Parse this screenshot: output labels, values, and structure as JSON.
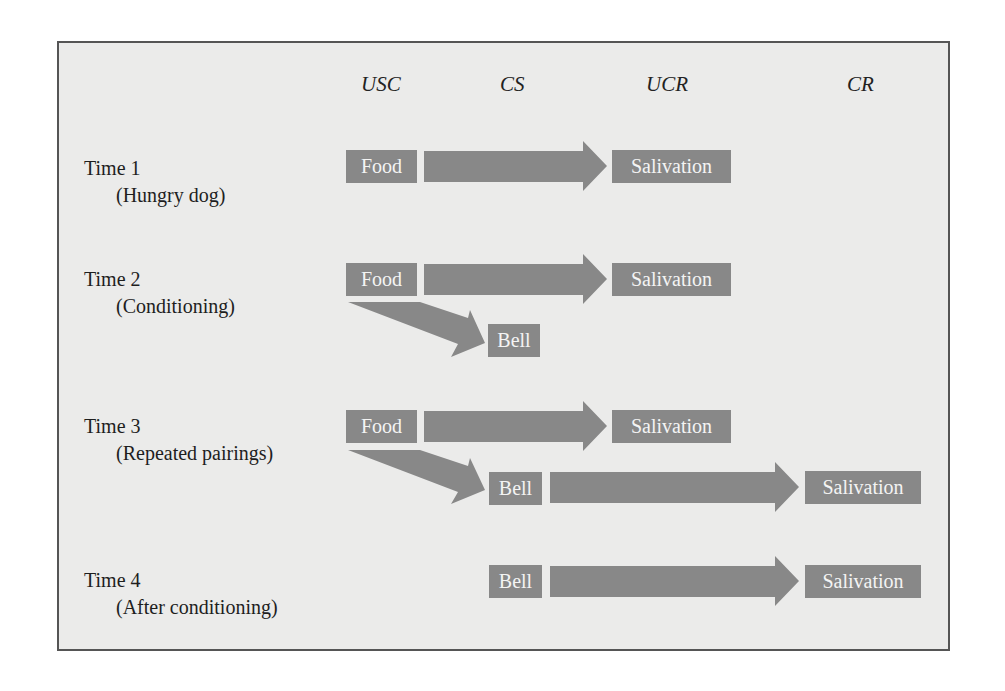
{
  "colors": {
    "background": "#ebebea",
    "box_fill": "#888888",
    "box_text": "#f4f4f4",
    "border": "#555555"
  },
  "headers": {
    "usc": "USC",
    "cs": "CS",
    "ucr": "UCR",
    "cr": "CR"
  },
  "rows": [
    {
      "time": "Time 1",
      "desc": "(Hungry dog)",
      "food": "Food",
      "ucr": "Salivation"
    },
    {
      "time": "Time 2",
      "desc": "(Conditioning)",
      "food": "Food",
      "ucr": "Salivation",
      "cs": "Bell"
    },
    {
      "time": "Time 3",
      "desc": "(Repeated pairings)",
      "food": "Food",
      "ucr": "Salivation",
      "cs": "Bell",
      "cr": "Salivation"
    },
    {
      "time": "Time 4",
      "desc": "(After conditioning)",
      "cs": "Bell",
      "cr": "Salivation"
    }
  ]
}
